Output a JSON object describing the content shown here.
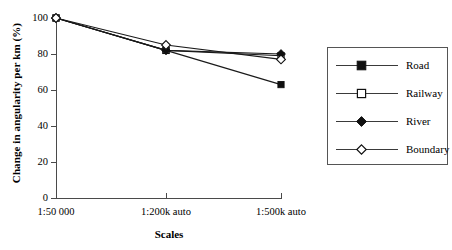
{
  "chart_data": {
    "type": "line",
    "title": "",
    "xlabel": "Scales",
    "ylabel": "Change in angularity per km (%)",
    "categories": [
      "1:50 000",
      "1:200k auto",
      "1:500k auto"
    ],
    "ylim": [
      0,
      100
    ],
    "yticks": [
      0,
      20,
      40,
      60,
      80,
      100
    ],
    "grid": false,
    "legend_position": "right-outside",
    "series": [
      {
        "name": "Road",
        "marker": "filled-square",
        "values": [
          100,
          82,
          63
        ]
      },
      {
        "name": "Railway",
        "marker": "open-square",
        "values": [
          100,
          82,
          79
        ]
      },
      {
        "name": "River",
        "marker": "filled-diamond",
        "values": [
          100,
          82,
          80
        ]
      },
      {
        "name": "Boundary",
        "marker": "open-diamond",
        "values": [
          100,
          85,
          77
        ]
      }
    ],
    "colors": {
      "line": "#1a1a1a",
      "axis": "#4a4a4a",
      "marker_fill": "#101010",
      "marker_open": "#ffffff"
    }
  },
  "axes": {
    "y_tick_labels": [
      "100",
      "80",
      "60",
      "40",
      "20",
      "0"
    ],
    "y_title": "Change in angularity per km (%)",
    "x_title": "Scales",
    "x_tick_labels": [
      "1:50 000",
      "1:200k auto",
      "1:500k auto"
    ]
  },
  "legend": {
    "items": [
      {
        "label": "Road",
        "marker": "filled-square"
      },
      {
        "label": "Railway",
        "marker": "open-square"
      },
      {
        "label": "River",
        "marker": "filled-diamond"
      },
      {
        "label": "Boundary",
        "marker": "open-diamond"
      }
    ]
  }
}
